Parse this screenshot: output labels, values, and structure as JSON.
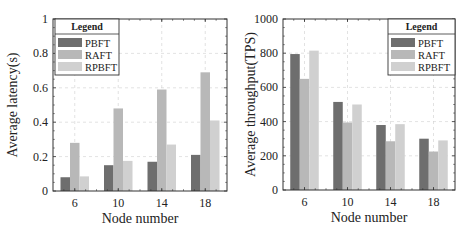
{
  "colors": {
    "PBFT": "#6e6e6e",
    "RAFT": "#b8b8b8",
    "RPBFT": "#d0d0d0",
    "axis": "#333333",
    "grid": "#cfcfcf"
  },
  "chart_data": [
    {
      "type": "bar",
      "title": "",
      "xlabel": "Node number",
      "ylabel": "Average latency(s)",
      "categories": [
        "6",
        "10",
        "14",
        "18"
      ],
      "ylim": [
        0,
        1
      ],
      "yticks": [
        0,
        0.2,
        0.4,
        0.6,
        0.8,
        1
      ],
      "ytick_labels": [
        "0",
        "0.2",
        "0.4",
        "0.6",
        "0.8",
        "1"
      ],
      "grid": true,
      "legend": {
        "title": "Legend",
        "position": "upper left",
        "entries": [
          "PBFT",
          "RAFT",
          "RPBFT"
        ]
      },
      "series": [
        {
          "name": "PBFT",
          "values": [
            0.08,
            0.15,
            0.17,
            0.21
          ]
        },
        {
          "name": "RAFT",
          "values": [
            0.28,
            0.48,
            0.59,
            0.69
          ]
        },
        {
          "name": "RPBFT",
          "values": [
            0.085,
            0.175,
            0.27,
            0.41
          ]
        }
      ]
    },
    {
      "type": "bar",
      "title": "",
      "xlabel": "Node number",
      "ylabel": "Average throughput(TPS)",
      "categories": [
        "6",
        "10",
        "14",
        "18"
      ],
      "ylim": [
        0,
        1000
      ],
      "yticks": [
        0,
        200,
        400,
        600,
        800,
        1000
      ],
      "ytick_labels": [
        "0",
        "200",
        "400",
        "600",
        "800",
        "1000"
      ],
      "grid": true,
      "legend": {
        "title": "Legend",
        "position": "upper right",
        "entries": [
          "PBFT",
          "RAFT",
          "RPBFT"
        ]
      },
      "series": [
        {
          "name": "PBFT",
          "values": [
            795,
            515,
            380,
            300
          ]
        },
        {
          "name": "RAFT",
          "values": [
            650,
            395,
            285,
            225
          ]
        },
        {
          "name": "RPBFT",
          "values": [
            815,
            500,
            385,
            290
          ]
        }
      ]
    }
  ]
}
